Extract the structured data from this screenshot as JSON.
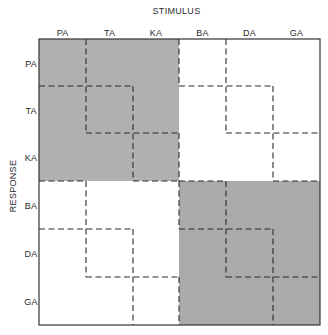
{
  "figure": {
    "x_title": "STIMULUS",
    "y_title": "RESPONSE",
    "columns": [
      "PA",
      "TA",
      "KA",
      "BA",
      "DA",
      "GA"
    ],
    "rows": [
      "PA",
      "TA",
      "KA",
      "BA",
      "DA",
      "GA"
    ],
    "grid": {
      "x": [
        39,
        86,
        133,
        179,
        226,
        273,
        320
      ],
      "y": [
        39,
        86,
        133,
        181,
        229,
        277,
        325
      ]
    },
    "shaded_blocks": [
      {
        "name": "voiceless-block",
        "col0": 0,
        "row0": 0,
        "cols": 3,
        "rows": 3,
        "color": "#b3b3b3"
      },
      {
        "name": "voiced-block",
        "col0": 3,
        "row0": 3,
        "cols": 3,
        "rows": 3,
        "color": "#a9a9a9"
      }
    ],
    "dashed_crosses_per_block": [
      [
        0,
        0
      ],
      [
        1,
        1
      ],
      [
        2,
        2
      ],
      [
        3,
        3
      ]
    ],
    "blocks": [
      [
        0,
        0
      ],
      [
        3,
        0
      ],
      [
        0,
        3
      ],
      [
        3,
        3
      ]
    ],
    "colors": {
      "frame": "#333333",
      "dash": "#2a2a2a",
      "background": "#ffffff"
    }
  }
}
